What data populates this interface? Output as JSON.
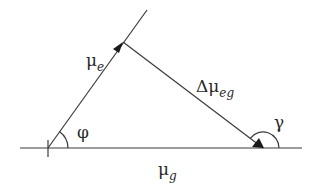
{
  "diagram": {
    "type": "vector-diagram",
    "colors": {
      "line": "#3a3a3a",
      "text": "#2a2a2a",
      "background": "#ffffff"
    },
    "vectors": {
      "mu_e": {
        "symbol": "μ",
        "subscript": "e"
      },
      "delta_mu_eg": {
        "symbol": "Δμ",
        "subscript": "eg"
      },
      "mu_g": {
        "symbol": "μ",
        "subscript": "g"
      }
    },
    "angles": {
      "phi": "φ",
      "gamma": "γ"
    }
  }
}
